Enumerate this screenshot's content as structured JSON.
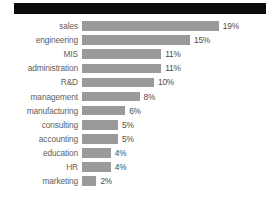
{
  "redaction": {
    "present": true,
    "color": "#0b0b0b",
    "note": ""
  },
  "style": {
    "bar_color": "#9a9a9a",
    "label_color": "#5e5e5e",
    "value_color": "#4a4a4a",
    "background": "#ffffff",
    "px_per_percent": 7.2
  },
  "chart_data": {
    "type": "bar",
    "orientation": "horizontal",
    "title": "",
    "subtitle": "",
    "xlabel": "",
    "ylabel": "",
    "grid": false,
    "legend": false,
    "xlim": [
      0,
      20
    ],
    "unit": "%",
    "categories": [
      "sales",
      "engineering",
      "MIS",
      "administration",
      "R&D",
      "management",
      "manufacturing",
      "consulting",
      "accounting",
      "education",
      "HR",
      "marketing"
    ],
    "values": [
      19,
      15,
      11,
      11,
      10,
      8,
      6,
      5,
      5,
      4,
      4,
      2
    ],
    "value_labels": [
      "19%",
      "15%",
      "11%",
      "11%",
      "10%",
      "8%",
      "6%",
      "5%",
      "5%",
      "4%",
      "4%",
      "2%"
    ]
  }
}
